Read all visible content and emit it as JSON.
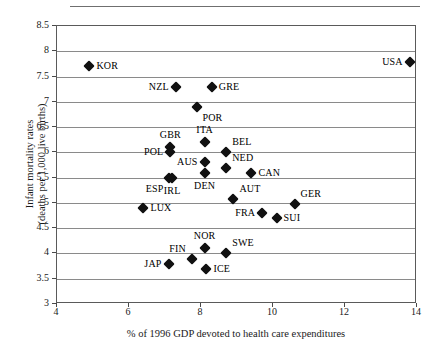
{
  "chart_data": {
    "type": "scatter",
    "title": "",
    "xlabel": "% of 1996 GDP devoted to health care expenditures",
    "ylabel_line1": "Infant mortality rates",
    "ylabel_line2": "(deaths per 1,000 live births)",
    "xlim": [
      4,
      14
    ],
    "ylim": [
      3,
      8.5
    ],
    "xticks": [
      4,
      6,
      8,
      10,
      12,
      14
    ],
    "xtick_labels": [
      "4",
      "6",
      "8",
      "10",
      "12",
      "14"
    ],
    "yticks": [
      3,
      3.5,
      4,
      4.5,
      5,
      5.5,
      6,
      6.5,
      7,
      7.5,
      8,
      8.5
    ],
    "ytick_labels": [
      "3",
      "3.5",
      "4",
      "4.5",
      "5",
      "5.5",
      "6",
      "6.5",
      "7",
      "7.5",
      "8",
      "8.5"
    ],
    "grid": "horizontal",
    "legend": "none",
    "marker": "diamond",
    "marker_color": "#111111",
    "points": [
      {
        "label": "KOR",
        "x": 4.9,
        "y": 7.7,
        "label_pos": "right"
      },
      {
        "label": "USA",
        "x": 13.8,
        "y": 7.78,
        "label_pos": "left"
      },
      {
        "label": "NZL",
        "x": 7.3,
        "y": 7.3,
        "label_pos": "left"
      },
      {
        "label": "GRE",
        "x": 8.3,
        "y": 7.3,
        "label_pos": "right"
      },
      {
        "label": "POR",
        "x": 7.9,
        "y": 6.9,
        "label_pos": "below-right"
      },
      {
        "label": "ITA",
        "x": 8.1,
        "y": 6.2,
        "label_pos": "above"
      },
      {
        "label": "GBR",
        "x": 7.15,
        "y": 6.1,
        "label_pos": "above"
      },
      {
        "label": "BEL",
        "x": 8.7,
        "y": 6.0,
        "label_pos": "above-right"
      },
      {
        "label": "POL",
        "x": 7.15,
        "y": 6.0,
        "label_pos": "left"
      },
      {
        "label": "AUS",
        "x": 8.1,
        "y": 5.8,
        "label_pos": "left"
      },
      {
        "label": "NED",
        "x": 8.7,
        "y": 5.7,
        "label_pos": "above-right"
      },
      {
        "label": "DEN",
        "x": 8.1,
        "y": 5.6,
        "label_pos": "below"
      },
      {
        "label": "CAN",
        "x": 9.4,
        "y": 5.6,
        "label_pos": "right"
      },
      {
        "label": "ESP",
        "x": 7.1,
        "y": 5.5,
        "label_pos": "below-left"
      },
      {
        "label": "IRL",
        "x": 7.2,
        "y": 5.5,
        "label_pos": "below"
      },
      {
        "label": "AUT",
        "x": 8.9,
        "y": 5.08,
        "label_pos": "above-right"
      },
      {
        "label": "GER",
        "x": 10.6,
        "y": 4.98,
        "label_pos": "above-right"
      },
      {
        "label": "LUX",
        "x": 6.4,
        "y": 4.9,
        "label_pos": "right"
      },
      {
        "label": "FRA",
        "x": 9.7,
        "y": 4.8,
        "label_pos": "left"
      },
      {
        "label": "SUI",
        "x": 10.1,
        "y": 4.7,
        "label_pos": "right"
      },
      {
        "label": "NOR",
        "x": 8.1,
        "y": 4.1,
        "label_pos": "above"
      },
      {
        "label": "SWE",
        "x": 8.7,
        "y": 4.0,
        "label_pos": "above-right"
      },
      {
        "label": "FIN",
        "x": 7.75,
        "y": 3.9,
        "label_pos": "above-left"
      },
      {
        "label": "JAP",
        "x": 7.1,
        "y": 3.8,
        "label_pos": "left"
      },
      {
        "label": "ICE",
        "x": 8.15,
        "y": 3.7,
        "label_pos": "right"
      }
    ]
  }
}
